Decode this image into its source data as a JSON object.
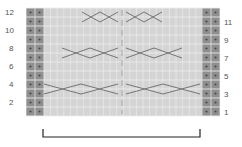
{
  "chart": {
    "rows": 12,
    "left_labels": [
      "12",
      "10",
      "8",
      "6",
      "4",
      "2"
    ],
    "right_labels": [
      "11",
      "9",
      "7",
      "5",
      "3",
      "1"
    ],
    "colors": {
      "grid_bg": "#d4d4d4",
      "grid_line": "#eeeeee",
      "garter_bg": "#8f8f8f",
      "garter_dot": "#4a4a4a",
      "cable_line": "#6a6a6a",
      "bracket": "#222222",
      "label": "#555555"
    },
    "cables": [
      {
        "row": 11,
        "crosses": [
          [
            82,
            100
          ],
          [
            100,
            118
          ],
          [
            126,
            144
          ],
          [
            144,
            162
          ]
        ]
      },
      {
        "row": 7,
        "crosses": [
          [
            62,
            90
          ],
          [
            90,
            118
          ],
          [
            126,
            154
          ],
          [
            154,
            182
          ]
        ]
      },
      {
        "row": 3,
        "crosses": [
          [
            44,
            81
          ],
          [
            81,
            118
          ],
          [
            126,
            163
          ],
          [
            163,
            200
          ]
        ]
      }
    ],
    "repeat_bracket": {
      "x1": 43,
      "x2": 200,
      "y": 137
    }
  }
}
